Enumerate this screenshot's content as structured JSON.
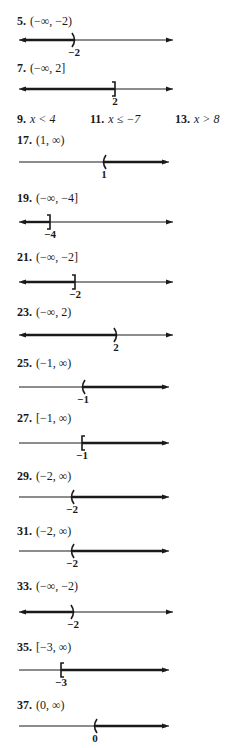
{
  "answers": [
    {
      "num": "5.",
      "interval": "(−∞, −2)",
      "label_y": 14,
      "line_y": 40,
      "mark_x": 74,
      "mark": ")",
      "tick": "−2",
      "shade": "left"
    },
    {
      "num": "7.",
      "interval": "(−∞, 2]",
      "label_y": 61,
      "line_y": 89,
      "mark_x": 115,
      "mark": "]",
      "tick": "2",
      "shade": "left"
    },
    {
      "num": "17.",
      "interval": "(1, ∞)",
      "label_y": 133,
      "line_y": 162,
      "mark_x": 104,
      "mark": "(",
      "tick": "1",
      "shade": "right"
    },
    {
      "num": "19.",
      "interval": "(−∞, −4]",
      "label_y": 191,
      "line_y": 222,
      "mark_x": 50,
      "mark": "]",
      "tick": "−4",
      "shade": "left"
    },
    {
      "num": "21.",
      "interval": "(−∞, −2]",
      "label_y": 250,
      "line_y": 282,
      "mark_x": 75,
      "mark": "]",
      "tick": "−2",
      "shade": "left"
    },
    {
      "num": "23.",
      "interval": "(−∞, 2)",
      "label_y": 305,
      "line_y": 335,
      "mark_x": 116,
      "mark": ")",
      "tick": "2",
      "shade": "left"
    },
    {
      "num": "25.",
      "interval": "(−1, ∞)",
      "label_y": 356,
      "line_y": 387,
      "mark_x": 83,
      "mark": "(",
      "tick": "−1",
      "shade": "right"
    },
    {
      "num": "27.",
      "interval": "[−1, ∞)",
      "label_y": 411,
      "line_y": 443,
      "mark_x": 82,
      "mark": "[",
      "tick": "−1",
      "shade": "right"
    },
    {
      "num": "29.",
      "interval": "(−2, ∞)",
      "label_y": 469,
      "line_y": 497,
      "mark_x": 72,
      "mark": "(",
      "tick": "−2",
      "shade": "right"
    },
    {
      "num": "31.",
      "interval": "(−2, ∞)",
      "label_y": 524,
      "line_y": 551,
      "mark_x": 72,
      "mark": "(",
      "tick": "−2",
      "shade": "right"
    },
    {
      "num": "33.",
      "interval": "(−∞, −2)",
      "label_y": 579,
      "line_y": 612,
      "mark_x": 73,
      "mark": ")",
      "tick": "−2",
      "shade": "left"
    },
    {
      "num": "35.",
      "interval": "[−3, ∞)",
      "label_y": 640,
      "line_y": 670,
      "mark_x": 61,
      "mark": "[",
      "tick": "−3",
      "shade": "right"
    },
    {
      "num": "37.",
      "interval": "(0, ∞)",
      "label_y": 698,
      "line_y": 726,
      "mark_x": 95,
      "mark": "(",
      "tick": "0",
      "shade": "right"
    }
  ],
  "inequalities": [
    {
      "num": "9.",
      "expr": "x < 4",
      "x": 17
    },
    {
      "num": "11.",
      "expr": "x ≤ −7",
      "x": 90
    },
    {
      "num": "13.",
      "expr": "x > 8",
      "x": 175
    }
  ],
  "inequalities_y": 112,
  "line": {
    "x_start": 19,
    "x_end_left_shade": 173,
    "x_end_right_shade": 169,
    "color": "#1a1a1a"
  }
}
